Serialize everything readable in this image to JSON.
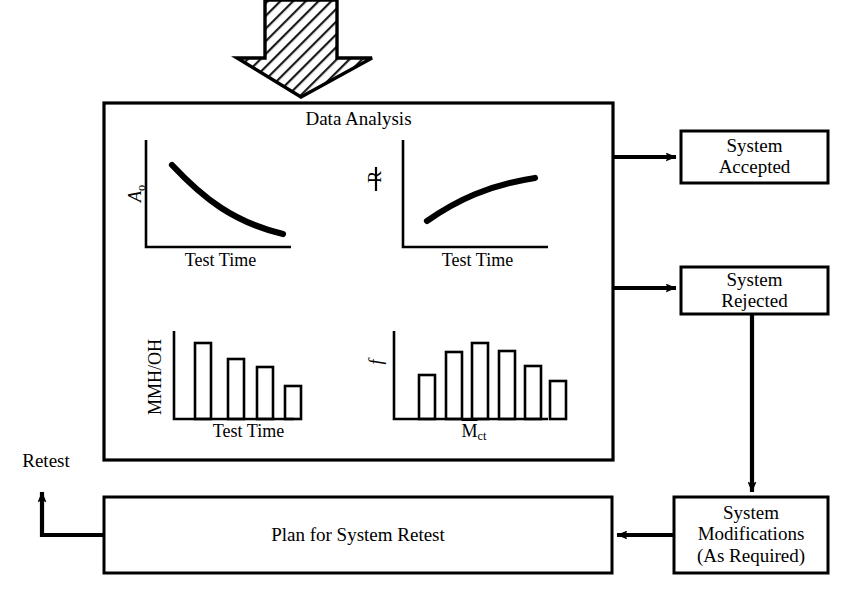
{
  "diagram": {
    "colors": {
      "line": "#000000",
      "background": "#ffffff",
      "hatch": "#1a1a1a"
    },
    "input_arrow": {
      "name": "hatched-down-arrow",
      "direction": "down",
      "style": "diagonal-hatch"
    },
    "main_box": {
      "title": "Data Analysis"
    },
    "charts": [
      {
        "id": "ao-vs-test-time",
        "type": "line",
        "ylabel": "A",
        "ylabel_sub": "o",
        "xlabel": "Test Time",
        "trend": "decreasing-convex",
        "x": [
          0.1,
          0.25,
          0.4,
          0.55,
          0.7,
          0.85,
          1.0
        ],
        "y": [
          0.92,
          0.74,
          0.58,
          0.45,
          0.35,
          0.28,
          0.24
        ],
        "grid": false
      },
      {
        "id": "r-vs-test-time",
        "type": "line",
        "ylabel": "R",
        "ylabel_underline": true,
        "xlabel": "Test Time",
        "trend": "increasing-concave",
        "x": [
          0.1,
          0.25,
          0.4,
          0.55,
          0.7,
          0.85,
          1.0
        ],
        "y": [
          0.14,
          0.36,
          0.53,
          0.65,
          0.74,
          0.81,
          0.86
        ],
        "grid": false
      },
      {
        "id": "mmh-oh-vs-test-time",
        "type": "bar",
        "ylabel": "MMH/OH",
        "xlabel": "Test Time",
        "categories": [
          "1",
          "2",
          "3",
          "4"
        ],
        "values": [
          0.82,
          0.64,
          0.56,
          0.34
        ],
        "grid": false
      },
      {
        "id": "frequency-vs-mct",
        "type": "bar",
        "ylabel": "f",
        "xlabel": "M̄ct",
        "xlabel_base": "M",
        "xlabel_sub": "ct",
        "xlabel_overbar": true,
        "categories": [
          "1",
          "2",
          "3",
          "4",
          "5",
          "6"
        ],
        "values": [
          0.42,
          0.7,
          0.82,
          0.74,
          0.54,
          0.36
        ],
        "grid": false
      }
    ],
    "boxes": [
      {
        "id": "system-accepted",
        "lines": [
          "System",
          "Accepted"
        ]
      },
      {
        "id": "system-rejected",
        "lines": [
          "System",
          "Rejected"
        ]
      },
      {
        "id": "system-modifications",
        "lines": [
          "System",
          "Modifications",
          "(As Required)"
        ]
      },
      {
        "id": "plan-for-system-retest",
        "lines": [
          "Plan for System Retest"
        ]
      }
    ],
    "annotations": [
      {
        "id": "retest-label",
        "text": "Retest"
      }
    ],
    "connectors": [
      {
        "id": "analysis-to-accepted",
        "from": "data-analysis",
        "to": "system-accepted",
        "direction": "right"
      },
      {
        "id": "analysis-to-rejected",
        "from": "data-analysis",
        "to": "system-rejected",
        "direction": "right"
      },
      {
        "id": "rejected-to-modifications",
        "from": "system-rejected",
        "to": "system-modifications",
        "direction": "down"
      },
      {
        "id": "modifications-to-plan",
        "from": "system-modifications",
        "to": "plan-for-system-retest",
        "direction": "left"
      },
      {
        "id": "plan-to-retest",
        "from": "plan-for-system-retest",
        "to": "retest-label",
        "direction": "up"
      }
    ]
  }
}
